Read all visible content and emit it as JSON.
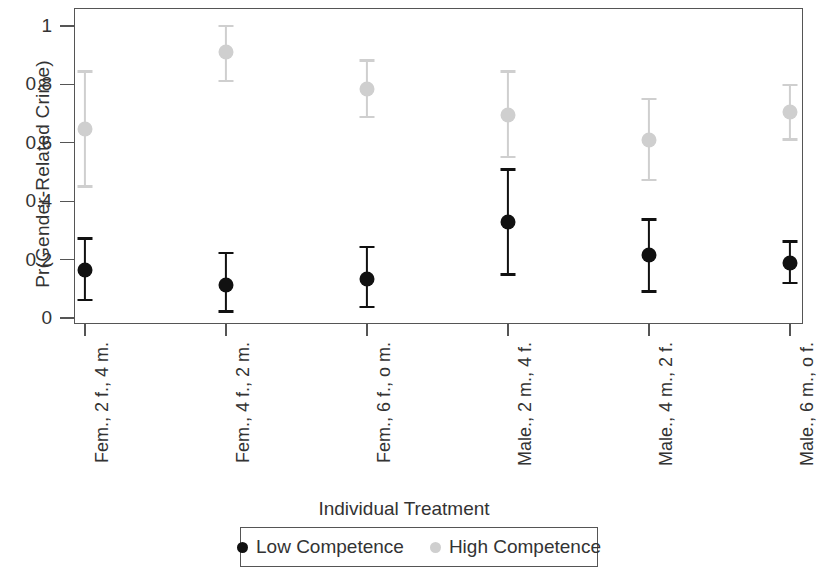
{
  "chart_data": {
    "type": "scatter",
    "title": "",
    "xlabel": "Individual Treatment",
    "ylabel": "Pr(Gender-Related Crime)",
    "ylim": [
      0,
      1
    ],
    "yticks": [
      "0",
      "0.2",
      "0.4",
      "0.6",
      "0.8",
      "1"
    ],
    "ytick_values": [
      0,
      0.2,
      0.4,
      0.6,
      0.8,
      1
    ],
    "grid": false,
    "legend_position": "bottom",
    "categories": [
      "Fem., 2 f., 4 m.",
      "Fem., 4 f., 2 m.",
      "Fem., 6 f., o m.",
      "Male., 2 m., 4 f.",
      "Male., 4 m., 2 f.",
      "Male., 6 m., o f."
    ],
    "series": [
      {
        "name": "Low Competence",
        "color": "#111111",
        "values": [
          0.165,
          0.112,
          0.135,
          0.33,
          0.215,
          0.19
        ],
        "ci_lower": [
          0.062,
          0.022,
          0.038,
          0.148,
          0.09,
          0.12
        ],
        "ci_upper": [
          0.272,
          0.222,
          0.243,
          0.508,
          0.338,
          0.262
        ]
      },
      {
        "name": "High Competence",
        "color": "#cfcfcf",
        "values": [
          0.648,
          0.912,
          0.785,
          0.695,
          0.61,
          0.705
        ],
        "ci_lower": [
          0.45,
          0.812,
          0.688,
          0.552,
          0.472,
          0.612
        ],
        "ci_upper": [
          0.845,
          1.0,
          0.882,
          0.845,
          0.75,
          0.798
        ]
      }
    ]
  },
  "legend": {
    "entries": [
      {
        "label": "Low Competence",
        "color": "#111111"
      },
      {
        "label": "High Competence",
        "color": "#cfcfcf"
      }
    ]
  }
}
